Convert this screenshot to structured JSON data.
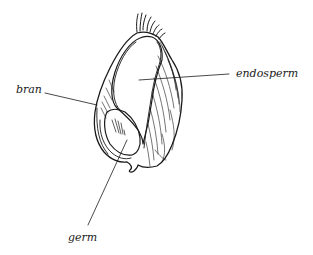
{
  "diagram": {
    "labels": [
      {
        "id": "bran",
        "text": "bran"
      },
      {
        "id": "endosperm",
        "text": "endosperm"
      },
      {
        "id": "germ",
        "text": "germ"
      }
    ],
    "colors": {
      "ink": "#1a1a1a",
      "background": "#ffffff"
    }
  }
}
